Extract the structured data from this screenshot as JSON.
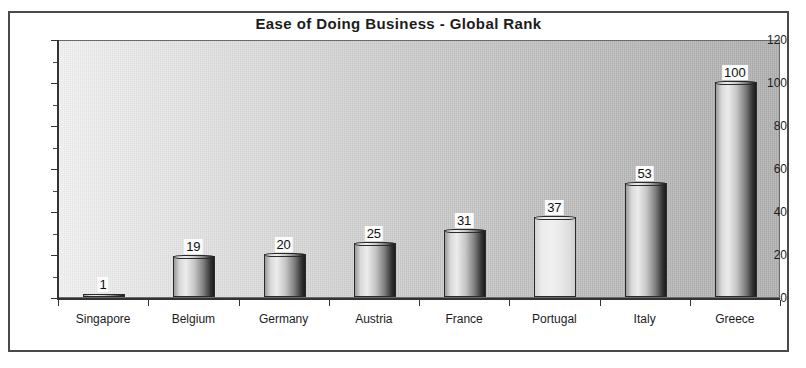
{
  "scan": {
    "top_bleed_text": "· ·"
  },
  "chart_data": {
    "type": "bar",
    "title": "Ease of Doing Business - Global Rank",
    "xlabel": "",
    "ylabel": "",
    "ylim": [
      0,
      120
    ],
    "yticks": [
      0,
      20,
      40,
      60,
      80,
      100,
      120
    ],
    "grid": false,
    "legend": "none",
    "categories": [
      "Singapore",
      "Belgium",
      "Germany",
      "Austria",
      "France",
      "Portugal",
      "Italy",
      "Greece"
    ],
    "values": [
      1,
      19,
      20,
      25,
      31,
      37,
      53,
      100
    ],
    "value_labels": [
      "1",
      "19",
      "20",
      "25",
      "31",
      "37",
      "53",
      "100"
    ],
    "highlighted_category": "Portugal",
    "bar_style": "cylinder",
    "colors": {
      "plot_background_left": "#f2f2f2",
      "plot_background_right": "#b0b0b0",
      "bar_light": "#ececec",
      "bar_dark": "#1c1c1c",
      "bar_highlight": "#f0f0f0",
      "axis": "#333333",
      "frame": "#4a4a4a",
      "text": "#1c1c1c"
    }
  }
}
